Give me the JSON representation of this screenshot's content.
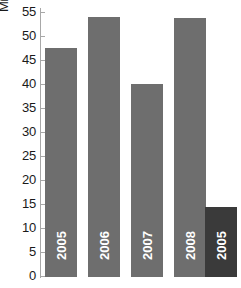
{
  "chart_data": {
    "type": "bar",
    "title": "",
    "xlabel": "",
    "ylabel": "Mill.",
    "ylim": [
      0,
      56
    ],
    "grid": false,
    "legend": "none",
    "yticks": [
      55,
      50,
      45,
      40,
      35,
      30,
      25,
      20,
      15,
      10,
      5,
      0
    ],
    "categories": [
      "2005",
      "2006",
      "2007",
      "2008",
      "2005"
    ],
    "values": [
      47.7,
      54.2,
      40.2,
      54.0,
      14.5
    ],
    "series": [
      {
        "name": "",
        "values": [
          47.7,
          54.2,
          40.2,
          54.0,
          14.5
        ]
      }
    ],
    "bar_colors": [
      "#6e6e6e",
      "#6e6e6e",
      "#6e6e6e",
      "#6e6e6e",
      "#3a3a3a"
    ],
    "bar_labels": [
      "2005",
      "2006",
      "2007",
      "2008",
      "2005"
    ],
    "annotations": []
  },
  "axis": {
    "unit_label": "Mill.",
    "tick_labels": [
      "55",
      "50",
      "45",
      "40",
      "35",
      "30",
      "25",
      "20",
      "15",
      "10",
      "5",
      "0"
    ]
  },
  "colors": {
    "bar_default": "#6e6e6e",
    "bar_highlight": "#3a3a3a",
    "axis": "#a8a8a8",
    "text": "#1a1a1a",
    "bar_text": "#ffffff",
    "background": "#ffffff"
  }
}
